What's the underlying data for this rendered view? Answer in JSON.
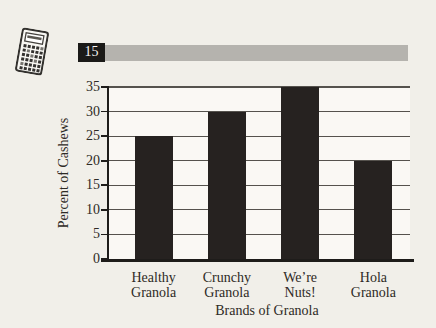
{
  "page": {
    "background_color": "#f1efe9"
  },
  "header": {
    "problem_number": "15",
    "number_box_color": "#1b1a18",
    "number_text_color": "#f6f5f1",
    "banner_bar_color": "#b5b3ae",
    "icon": "scientific-calculator"
  },
  "chart_data": {
    "type": "bar",
    "title": "",
    "categories": [
      "Healthy\nGranola",
      "Crunchy\nGranola",
      "We’re\nNuts!",
      "Hola\nGranola"
    ],
    "values": [
      25,
      30,
      35,
      20
    ],
    "xlabel": "Brands of Granola",
    "ylabel": "Percent of Cashews",
    "ylim": [
      0,
      35
    ],
    "yticks": [
      0,
      5,
      10,
      15,
      20,
      25,
      30,
      35
    ],
    "grid": true,
    "legend": false,
    "bar_color": "#262220",
    "axis_color": "#1e1c1a",
    "gridline_color": "#55524d",
    "text_color": "#2e2a25",
    "plot_background": "#faf8f4"
  }
}
